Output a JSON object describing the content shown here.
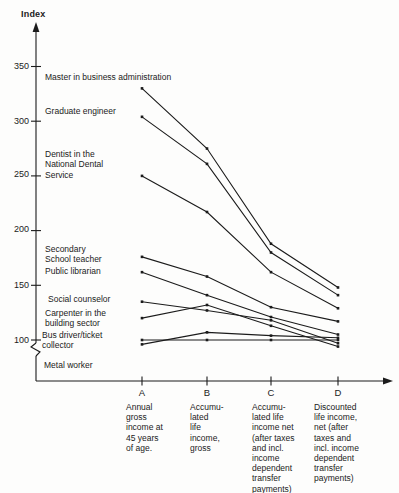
{
  "figure": {
    "axis_title": "Index",
    "y_ticks": [
      "350",
      "300",
      "250",
      "200",
      "150",
      "100"
    ]
  },
  "chart_data": {
    "type": "line",
    "title": "Index",
    "xlabel": "",
    "ylabel": "Index",
    "ylim": [
      90,
      370
    ],
    "y_tick_values": [
      100,
      150,
      200,
      250,
      300,
      350
    ],
    "grid": false,
    "legend_position": "labels-at-line-start",
    "categories": [
      "A",
      "B",
      "C",
      "D"
    ],
    "columns": [
      {
        "letter": "A",
        "label": "Annual\ngross\nincome at\n45 years\nof age."
      },
      {
        "letter": "B",
        "label": "Accumu-\nlated\nlife\nincome,\ngross"
      },
      {
        "letter": "C",
        "label": "Accumu-\nlated life\nincome net\n(after taxes\nand incl.\nincome\ndependent\ntransfer\npayments)"
      },
      {
        "letter": "D",
        "label": "Discounted\nlife income,\nnet (after\ntaxes and\nincl. income\ndependent\ntransfer\npayments)"
      }
    ],
    "series": [
      {
        "name": "Master in business administration",
        "label": "Master in business administration",
        "values": [
          330,
          275,
          188,
          148
        ]
      },
      {
        "name": "Graduate engineer",
        "label": "Graduate engineer",
        "values": [
          304,
          261,
          180,
          141
        ]
      },
      {
        "name": "Dentist in the National Dental Service",
        "label": "Dentist in the\nNational Dental\nService",
        "values": [
          250,
          217,
          162,
          129
        ]
      },
      {
        "name": "Secondary School teacher",
        "label": "Secondary\nSchool teacher",
        "values": [
          176,
          158,
          130,
          117
        ]
      },
      {
        "name": "Public librarian",
        "label": "Public librarian",
        "values": [
          162,
          141,
          121,
          105
        ]
      },
      {
        "name": "Social counselor",
        "label": "Social counselor",
        "values": [
          135,
          127,
          118,
          97
        ]
      },
      {
        "name": "Carpenter in the building sector",
        "label": "Carpenter in the\nbuilding sector",
        "values": [
          120,
          132,
          113,
          94
        ]
      },
      {
        "name": "Bus driver/ticket collector",
        "label": "Bus driver/ticket\ncollector",
        "values": [
          96,
          107,
          104,
          102
        ]
      },
      {
        "name": "Metal worker",
        "label": "Metal worker",
        "values": [
          100,
          100,
          100,
          100
        ]
      }
    ],
    "colors": {
      "line": "#1b1b1b",
      "background": "#fdfdfc"
    }
  }
}
